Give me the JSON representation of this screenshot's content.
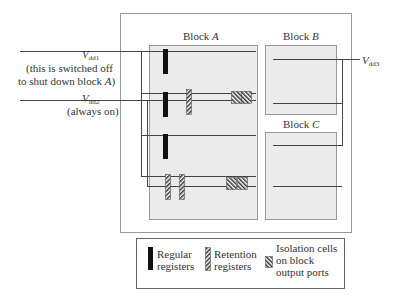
{
  "diagram": {
    "blocks": [
      {
        "id": "A",
        "label": "Block",
        "name": "A"
      },
      {
        "id": "B",
        "label": "Block",
        "name": "B"
      },
      {
        "id": "C",
        "label": "Block",
        "name": "C"
      }
    ],
    "supplies": {
      "vdd1": {
        "symbol": "V",
        "subscript": "dd1",
        "note_line1": "(this is switched off",
        "note_line2_prefix": "to shut down block ",
        "note_line2_block": "A",
        "note_line2_suffix": ")"
      },
      "vdd2": {
        "symbol": "V",
        "subscript": "dd2",
        "note": "(always on)"
      },
      "vdd3": {
        "symbol": "V",
        "subscript": "dd3"
      }
    },
    "legend": {
      "regular": {
        "line1": "Regular",
        "line2": "registers"
      },
      "retention": {
        "line1": "Retention",
        "line2": "registers"
      },
      "isolation": {
        "line1": "Isolation cells",
        "line2": "on block",
        "line3": "output ports"
      }
    },
    "colors": {
      "block_fill": "#ebebeb",
      "border": "#888888",
      "line": "#444444",
      "register": "#111111"
    }
  }
}
